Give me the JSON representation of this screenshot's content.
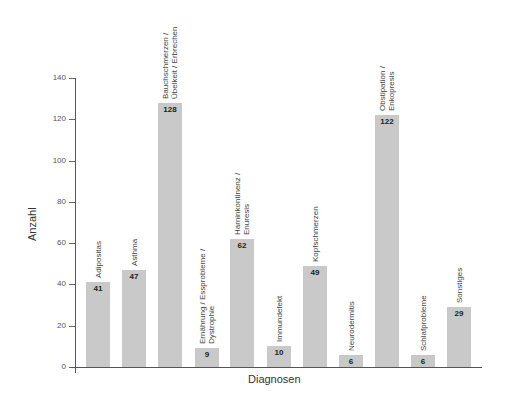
{
  "chart_data": {
    "type": "bar",
    "title": "",
    "xlabel": "Diagnosen",
    "ylabel": "Anzahl",
    "ylim": [
      0,
      140
    ],
    "yticks": [
      0,
      20,
      40,
      60,
      80,
      100,
      120,
      140
    ],
    "grid": false,
    "legend": null,
    "categories": [
      "Adipositas",
      "Asthma",
      "Bauchschmerzen / Übelkeit / Erbrechen",
      "Ernährung / Essprobleme / Dystrophie",
      "Harninkontinenz / Enuresis",
      "Immundefekt",
      "Kopfschmerzen",
      "Neurodermitis",
      "Obstipation / Enkopresis",
      "Schlafprobleme",
      "Sonstiges"
    ],
    "category_label_lines": [
      [
        "Adipositas"
      ],
      [
        "Asthma"
      ],
      [
        "Bauchschmerzen /",
        "Übelkeit / Erbrechen"
      ],
      [
        "Ernährung / Essprobleme /",
        "Dystrophie"
      ],
      [
        "Harninkontinenz /",
        "Enuresis"
      ],
      [
        "Immundefekt"
      ],
      [
        "Kopfschmerzen"
      ],
      [
        "Neurodermitis"
      ],
      [
        "Obstipation /",
        "Enkopresis"
      ],
      [
        "Schlafprobleme"
      ],
      [
        "Sonstiges"
      ]
    ],
    "values": [
      41,
      47,
      128,
      9,
      62,
      10,
      49,
      6,
      122,
      6,
      29
    ],
    "bar_color": "#c9c9c9"
  }
}
